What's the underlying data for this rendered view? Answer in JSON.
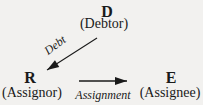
{
  "colors": {
    "background": "#f2f1ef",
    "ink": "#1a1a1a"
  },
  "nodes": {
    "debtor": {
      "letter": "D",
      "label": "(Debtor)"
    },
    "assignor": {
      "letter": "R",
      "label": "(Assignor)"
    },
    "assignee": {
      "letter": "E",
      "label": "(Assignee)"
    }
  },
  "edges": {
    "debt": {
      "label": "Debt",
      "from": "D",
      "to": "R"
    },
    "assignment": {
      "label": "Assignment",
      "from": "R",
      "to": "E"
    }
  }
}
